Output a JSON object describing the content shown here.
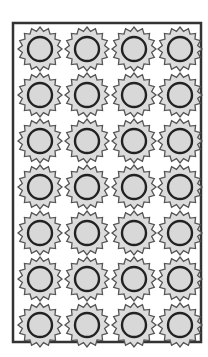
{
  "figure": {
    "rows": 7,
    "columns": 4,
    "border": {
      "x": 13,
      "y": 23,
      "width": 188,
      "height": 319
    },
    "col_centers": [
      40,
      87,
      134,
      180
    ],
    "row_centers": [
      49,
      95,
      141,
      187,
      233,
      279,
      325
    ],
    "gear": {
      "teeth": 16,
      "outer_radius": 22,
      "root_radius": 18,
      "inner_radius": 12
    },
    "colors": {
      "background": "#ffffff",
      "border": "#333333",
      "gear_fill": "#dcdcdc",
      "gear_stroke": "#555555",
      "hub_fill": "#d8d8d8",
      "hub_ring": "#222222"
    }
  }
}
